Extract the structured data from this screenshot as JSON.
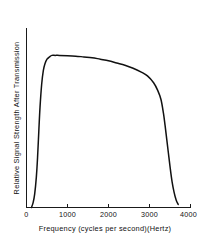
{
  "chart_data": {
    "type": "line",
    "title": "",
    "xlabel": "Frequency (cycles per second)(Hertz)",
    "ylabel": "Relative Signal Strength After Transmission",
    "xlim": [
      0,
      4000
    ],
    "ylim": [
      0,
      1.18
    ],
    "grid": false,
    "legend": null,
    "x_ticks": [
      {
        "value": 0,
        "label": "0"
      },
      {
        "value": 1000,
        "label": "1000"
      },
      {
        "value": 2000,
        "label": "2000"
      },
      {
        "value": 3000,
        "label": "3000"
      },
      {
        "value": 4000,
        "label": "4000"
      }
    ],
    "y_ticks": [],
    "series": [
      {
        "name": "Relative Signal Strength After Transmission",
        "color": "#111111",
        "x": [
          120,
          160,
          200,
          240,
          270,
          300,
          330,
          370,
          410,
          450,
          500,
          560,
          620,
          700,
          800,
          1000,
          1200,
          1400,
          1600,
          1800,
          2000,
          2200,
          2400,
          2600,
          2800,
          2950,
          3100,
          3200,
          3280,
          3340,
          3380,
          3420,
          3460,
          3500,
          3550,
          3600,
          3650,
          3700
        ],
        "y": [
          0.0,
          0.03,
          0.09,
          0.2,
          0.33,
          0.5,
          0.66,
          0.81,
          0.9,
          0.945,
          0.975,
          0.99,
          1.0,
          1.0,
          1.0,
          0.998,
          0.995,
          0.99,
          0.985,
          0.975,
          0.965,
          0.95,
          0.935,
          0.915,
          0.89,
          0.865,
          0.82,
          0.77,
          0.71,
          0.62,
          0.54,
          0.45,
          0.36,
          0.27,
          0.17,
          0.1,
          0.05,
          0.02
        ]
      }
    ],
    "annotations": []
  },
  "axes": {
    "x_axis_name": "frequency-axis",
    "y_axis_name": "signal-strength-axis"
  }
}
